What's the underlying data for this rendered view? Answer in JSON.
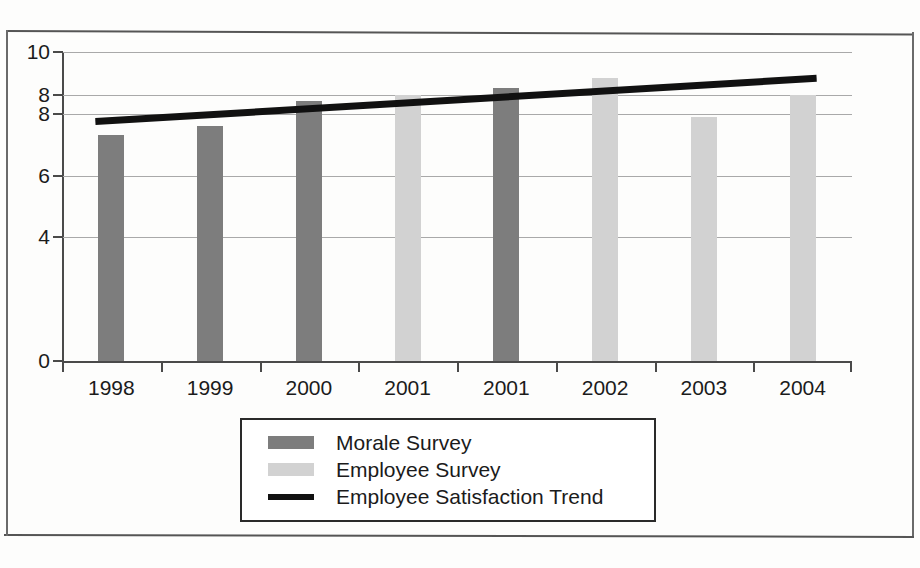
{
  "chart_data": {
    "type": "bar",
    "title": "",
    "xlabel": "",
    "ylabel": "",
    "ylim": [
      0,
      10
    ],
    "grid": true,
    "legend_position": "bottom",
    "categories": [
      "1998",
      "1999",
      "2000",
      "2001",
      "2001",
      "2002",
      "2003",
      "2004"
    ],
    "y_tick_labels": [
      "10",
      "8",
      "8",
      "6",
      "4",
      "0"
    ],
    "y_tick_values": [
      10,
      8.6,
      8,
      6,
      4,
      0
    ],
    "series": [
      {
        "name": "Morale Survey",
        "color": "#7d7d7d",
        "type": "bar",
        "values": [
          7.3,
          7.6,
          8.4,
          null,
          8.85,
          null,
          null,
          null
        ]
      },
      {
        "name": "Employee Survey",
        "color": "#d2d2d2",
        "type": "bar",
        "values": [
          null,
          null,
          null,
          8.6,
          null,
          9.15,
          7.9,
          8.6
        ]
      },
      {
        "name": "Employee Satisfaction Trend",
        "color": "#111111",
        "type": "line",
        "values": [
          7.75,
          7.95,
          8.15,
          8.35,
          8.55,
          8.75,
          8.95,
          9.15
        ]
      }
    ],
    "bar_assignments": [
      {
        "category": "1998",
        "series": "Morale Survey",
        "value": 7.3
      },
      {
        "category": "1999",
        "series": "Morale Survey",
        "value": 7.6
      },
      {
        "category": "2000",
        "series": "Morale Survey",
        "value": 8.4
      },
      {
        "category": "2001",
        "series": "Employee Survey",
        "value": 8.6
      },
      {
        "category": "2001",
        "series": "Morale Survey",
        "value": 8.85
      },
      {
        "category": "2002",
        "series": "Employee Survey",
        "value": 9.15
      },
      {
        "category": "2003",
        "series": "Employee Survey",
        "value": 7.9
      },
      {
        "category": "2004",
        "series": "Employee Survey",
        "value": 8.6
      }
    ]
  },
  "legend": {
    "items": [
      {
        "label": "Morale Survey",
        "marker": "dark-swatch"
      },
      {
        "label": "Employee Survey",
        "marker": "light-swatch"
      },
      {
        "label": "Employee Satisfaction Trend",
        "marker": "black-line"
      }
    ]
  }
}
